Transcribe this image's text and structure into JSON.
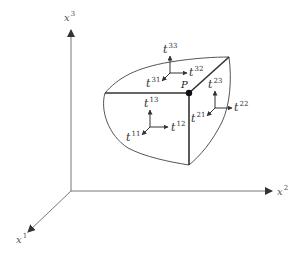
{
  "diagram": {
    "axes": {
      "x1": {
        "base": "x",
        "sup": "1"
      },
      "x2": {
        "base": "x",
        "sup": "2"
      },
      "x3": {
        "base": "x",
        "sup": "3"
      }
    },
    "point": {
      "label": "P"
    },
    "faces": {
      "front": [
        {
          "base": "t",
          "sup": "11"
        },
        {
          "base": "t",
          "sup": "12"
        },
        {
          "base": "t",
          "sup": "13"
        }
      ],
      "right": [
        {
          "base": "t",
          "sup": "21"
        },
        {
          "base": "t",
          "sup": "22"
        },
        {
          "base": "t",
          "sup": "23"
        }
      ],
      "top": [
        {
          "base": "t",
          "sup": "31"
        },
        {
          "base": "t",
          "sup": "32"
        },
        {
          "base": "t",
          "sup": "33"
        }
      ]
    },
    "colors": {
      "axis": "#777777",
      "edge": "#333333",
      "curve": "#555555",
      "arrow": "#333333"
    }
  }
}
